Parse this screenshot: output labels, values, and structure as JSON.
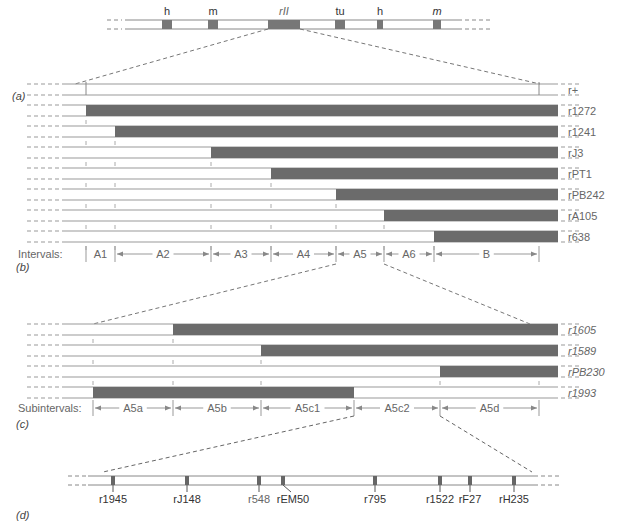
{
  "panels": {
    "a": "(a)",
    "b": "(b)",
    "c": "(c)",
    "d": "(d)"
  },
  "chromosome": {
    "genes": [
      {
        "label": "h",
        "x": 162,
        "w": 10
      },
      {
        "label": "m",
        "x": 208,
        "w": 10
      },
      {
        "label": "rII",
        "x": 268,
        "w": 32
      },
      {
        "label": "tu",
        "x": 335,
        "w": 10
      },
      {
        "label": "h",
        "x": 377,
        "w": 6
      },
      {
        "label": "m",
        "x": 433,
        "w": 8
      }
    ]
  },
  "section_b": {
    "interval_prefix": "Intervals:",
    "intervals": [
      "A1",
      "A2",
      "A3",
      "A4",
      "A5",
      "A6",
      "B"
    ],
    "strains": [
      {
        "name": "r+",
        "deletion_start": null
      },
      {
        "name": "r1272",
        "deletion_start": 86
      },
      {
        "name": "r1241",
        "deletion_start": 115
      },
      {
        "name": "rJ3",
        "deletion_start": 211
      },
      {
        "name": "rPT1",
        "deletion_start": 271
      },
      {
        "name": "rPB242",
        "deletion_start": 336
      },
      {
        "name": "rA105",
        "deletion_start": 384
      },
      {
        "name": "r638",
        "deletion_start": 434
      }
    ]
  },
  "section_c": {
    "interval_prefix": "Subintervals:",
    "intervals": [
      "A5a",
      "A5b",
      "A5c1",
      "A5c2",
      "A5d"
    ],
    "strains": [
      {
        "name": "r1605",
        "del_from": 173,
        "del_to": 558
      },
      {
        "name": "r1589",
        "del_from": 261,
        "del_to": 558
      },
      {
        "name": "rPB230",
        "del_from": 440,
        "del_to": 558
      },
      {
        "name": "r1993",
        "del_from": 93,
        "del_to": 354
      }
    ]
  },
  "section_d": {
    "mutations": [
      {
        "name": "r1945",
        "x": 113
      },
      {
        "name": "rJ148",
        "x": 187
      },
      {
        "name": "r548",
        "x": 259
      },
      {
        "name": "rEM50",
        "x": 283
      },
      {
        "name": "r795",
        "x": 375
      },
      {
        "name": "r1522",
        "x": 440
      },
      {
        "name": "rF27",
        "x": 470
      },
      {
        "name": "rH235",
        "x": 514
      }
    ]
  },
  "colors": {
    "deletion": "#6b6b6b",
    "line": "#8a8a8a",
    "gene": "#777777"
  }
}
